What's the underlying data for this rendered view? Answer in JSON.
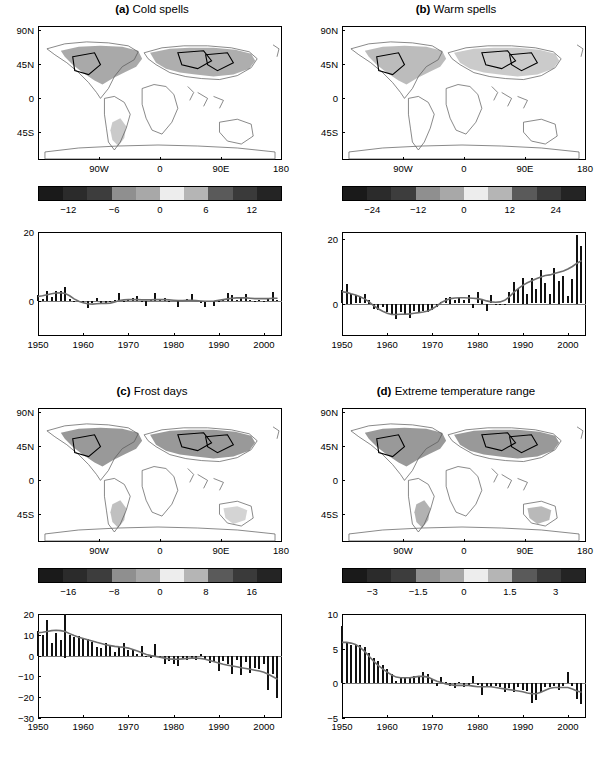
{
  "figure": {
    "panels": [
      {
        "key": "a",
        "tag": "(a)",
        "title": "Cold spells",
        "map": {
          "ylabels": [
            "90N",
            "45N",
            "0",
            "45S"
          ],
          "xlabels": [
            "90W",
            "0",
            "90E",
            "180"
          ]
        },
        "colorbar": {
          "ticks": [
            "−12",
            "−6",
            "0",
            "6",
            "12"
          ],
          "colors": [
            "#1a1a1a",
            "#2b2b2b",
            "#3d3d3d",
            "#8f8f8f",
            "#a8a8a8",
            "#ededed",
            "#b5b5b5",
            "#5a5a5a",
            "#3a3a3a",
            "#242424"
          ]
        },
        "chart_data": {
          "type": "bar",
          "title": "Cold spells anomaly",
          "xlabel": "",
          "ylabel": "",
          "ylim": [
            -10,
            20
          ],
          "xlim": [
            1950,
            2004
          ],
          "yticks": [
            0,
            20
          ],
          "ytick_labels": [
            "0",
            "20"
          ],
          "xticks": [
            1950,
            1960,
            1970,
            1980,
            1990,
            2000
          ],
          "xtick_labels": [
            "1950",
            "1960",
            "1970",
            "1980",
            "1990",
            "2000"
          ],
          "grid": false,
          "legend": "none",
          "x": [
            1950,
            1951,
            1952,
            1953,
            1954,
            1955,
            1956,
            1957,
            1958,
            1959,
            1960,
            1961,
            1962,
            1963,
            1964,
            1965,
            1966,
            1967,
            1968,
            1969,
            1970,
            1971,
            1972,
            1973,
            1974,
            1975,
            1976,
            1977,
            1978,
            1979,
            1980,
            1981,
            1982,
            1983,
            1984,
            1985,
            1986,
            1987,
            1988,
            1989,
            1990,
            1991,
            1992,
            1993,
            1994,
            1995,
            1996,
            1997,
            1998,
            1999,
            2000,
            2001,
            2002,
            2003
          ],
          "values": [
            1.8,
            0.6,
            3.0,
            1.2,
            3.1,
            3.0,
            4.0,
            0.8,
            0.2,
            -0.2,
            -0.4,
            -1.9,
            -0.6,
            0.9,
            -0.8,
            -0.6,
            -0.3,
            0.4,
            2.4,
            0.2,
            0.5,
            0.9,
            1.6,
            -0.2,
            -1.4,
            0.6,
            2.4,
            0.3,
            0.9,
            0.2,
            0.5,
            -1.5,
            0.5,
            0.7,
            2.1,
            0.4,
            -0.4,
            -1.6,
            0.2,
            -1.3,
            -0.3,
            0.6,
            2.3,
            1.8,
            0.5,
            0.9,
            2.2,
            0.4,
            0.2,
            0.3,
            0.2,
            0.6,
            2.6,
            0.5
          ],
          "smooth": [
            1.4,
            1.6,
            1.9,
            2.2,
            2.4,
            2.5,
            2.3,
            1.6,
            0.7,
            0.0,
            -0.4,
            -0.7,
            -0.8,
            -0.7,
            -0.6,
            -0.6,
            -0.5,
            -0.2,
            0.2,
            0.4,
            0.5,
            0.5,
            0.5,
            0.4,
            0.4,
            0.4,
            0.5,
            0.5,
            0.5,
            0.4,
            0.3,
            0.2,
            0.2,
            0.3,
            0.3,
            0.2,
            0.1,
            0.0,
            0.0,
            0.1,
            0.3,
            0.5,
            0.7,
            0.9,
            1.0,
            1.0,
            1.0,
            0.9,
            0.8,
            0.8,
            0.8,
            0.8,
            0.9,
            0.9
          ]
        }
      },
      {
        "key": "b",
        "tag": "(b)",
        "title": "Warm spells",
        "map": {
          "ylabels": [
            "90N",
            "45N",
            "0",
            "45S"
          ],
          "xlabels": [
            "90W",
            "0",
            "90E",
            "180"
          ]
        },
        "colorbar": {
          "ticks": [
            "−24",
            "−12",
            "0",
            "12",
            "24"
          ],
          "colors": [
            "#1a1a1a",
            "#2b2b2b",
            "#3d3d3d",
            "#8f8f8f",
            "#a8a8a8",
            "#ededed",
            "#b5b5b5",
            "#5a5a5a",
            "#3a3a3a",
            "#242424"
          ]
        },
        "chart_data": {
          "type": "bar",
          "title": "Warm spells anomaly",
          "xlabel": "",
          "ylabel": "",
          "ylim": [
            -10,
            22
          ],
          "xlim": [
            1950,
            2004
          ],
          "yticks": [
            0,
            20
          ],
          "ytick_labels": [
            "0",
            "20"
          ],
          "xticks": [
            1950,
            1960,
            1970,
            1980,
            1990,
            2000
          ],
          "xtick_labels": [
            "1950",
            "1960",
            "1970",
            "1980",
            "1990",
            "2000"
          ],
          "grid": false,
          "legend": "none",
          "x": [
            1950,
            1951,
            1952,
            1953,
            1954,
            1955,
            1956,
            1957,
            1958,
            1959,
            1960,
            1961,
            1962,
            1963,
            1964,
            1965,
            1966,
            1967,
            1968,
            1969,
            1970,
            1971,
            1972,
            1973,
            1974,
            1975,
            1976,
            1977,
            1978,
            1979,
            1980,
            1981,
            1982,
            1983,
            1984,
            1985,
            1986,
            1987,
            1988,
            1989,
            1990,
            1991,
            1992,
            1993,
            1994,
            1995,
            1996,
            1997,
            1998,
            1999,
            2000,
            2001,
            2002,
            2003
          ],
          "values": [
            4.2,
            6.0,
            3.0,
            2.6,
            2.4,
            2.8,
            1.0,
            -1.6,
            -2.0,
            -1.2,
            -2.6,
            -3.6,
            -4.8,
            -2.6,
            -3.2,
            -4.4,
            -2.2,
            -3.0,
            -2.2,
            -2.6,
            -2.0,
            -1.0,
            0.6,
            1.6,
            2.0,
            1.2,
            1.8,
            1.2,
            2.6,
            -1.4,
            3.4,
            1.0,
            -2.2,
            2.6,
            -0.6,
            -0.4,
            -0.6,
            3.6,
            6.6,
            4.4,
            8.0,
            3.0,
            7.8,
            4.6,
            10.2,
            6.4,
            3.0,
            10.8,
            7.0,
            8.6,
            2.4,
            7.4,
            21.0,
            17.6
          ],
          "smooth": [
            3.6,
            3.4,
            3.0,
            2.6,
            2.1,
            1.4,
            0.5,
            -0.6,
            -1.6,
            -2.4,
            -3.0,
            -3.4,
            -3.4,
            -3.3,
            -3.3,
            -3.2,
            -3.0,
            -2.8,
            -2.6,
            -2.3,
            -1.6,
            -0.7,
            0.3,
            1.0,
            1.5,
            1.7,
            1.8,
            1.8,
            1.7,
            1.6,
            1.5,
            1.2,
            0.8,
            0.5,
            0.4,
            0.5,
            1.0,
            2.0,
            3.4,
            4.6,
            5.6,
            6.4,
            7.0,
            7.6,
            8.2,
            8.6,
            8.8,
            9.2,
            9.6,
            10.0,
            10.6,
            11.4,
            12.4,
            13.2
          ]
        }
      },
      {
        "key": "c",
        "tag": "(c)",
        "title": "Frost days",
        "map": {
          "ylabels": [
            "90N",
            "45N",
            "0",
            "45S"
          ],
          "xlabels": [
            "90W",
            "0",
            "90E",
            "180"
          ]
        },
        "colorbar": {
          "ticks": [
            "−16",
            "−8",
            "0",
            "8",
            "16"
          ],
          "colors": [
            "#1a1a1a",
            "#2b2b2b",
            "#3d3d3d",
            "#8f8f8f",
            "#a8a8a8",
            "#ededed",
            "#b5b5b5",
            "#5a5a5a",
            "#3a3a3a",
            "#242424"
          ]
        },
        "chart_data": {
          "type": "bar",
          "title": "Frost days anomaly",
          "xlabel": "",
          "ylabel": "",
          "ylim": [
            -30,
            20
          ],
          "xlim": [
            1950,
            2004
          ],
          "yticks": [
            -30,
            -20,
            -10,
            0,
            10,
            20
          ],
          "ytick_labels": [
            "−30",
            "−20",
            "−10",
            "0",
            "10",
            "20"
          ],
          "xticks": [
            1950,
            1960,
            1970,
            1980,
            1990,
            2000
          ],
          "xtick_labels": [
            "1950",
            "1960",
            "1970",
            "1980",
            "1990",
            "2000"
          ],
          "grid": false,
          "legend": "none",
          "x": [
            1950,
            1951,
            1952,
            1953,
            1954,
            1955,
            1956,
            1957,
            1958,
            1959,
            1960,
            1961,
            1962,
            1963,
            1964,
            1965,
            1966,
            1967,
            1968,
            1969,
            1970,
            1971,
            1972,
            1973,
            1974,
            1975,
            1976,
            1977,
            1978,
            1979,
            1980,
            1981,
            1982,
            1983,
            1984,
            1985,
            1986,
            1987,
            1988,
            1989,
            1990,
            1991,
            1992,
            1993,
            1994,
            1995,
            1996,
            1997,
            1998,
            1999,
            2000,
            2001,
            2002,
            2003
          ],
          "values": [
            12.0,
            10.0,
            17.0,
            6.0,
            11.0,
            7.5,
            21.0,
            10.0,
            9.0,
            9.5,
            8.0,
            8.0,
            6.5,
            4.0,
            3.5,
            6.0,
            5.0,
            1.5,
            4.0,
            6.0,
            2.5,
            3.0,
            1.0,
            4.5,
            -0.5,
            -1.0,
            5.5,
            -1.0,
            -4.0,
            -2.5,
            -4.0,
            -5.0,
            -1.5,
            -2.0,
            -1.5,
            -2.0,
            1.0,
            -1.5,
            -3.5,
            -3.0,
            -7.5,
            -2.5,
            -4.0,
            -9.0,
            -2.0,
            -9.5,
            -3.0,
            -8.5,
            -6.0,
            -6.5,
            -4.0,
            -16.5,
            -9.0,
            -20.5
          ],
          "smooth": [
            11.0,
            11.2,
            11.6,
            12.0,
            12.2,
            12.0,
            11.6,
            10.6,
            9.6,
            8.8,
            8.2,
            7.6,
            7.0,
            6.4,
            5.8,
            5.2,
            4.8,
            4.4,
            4.2,
            4.0,
            3.6,
            3.0,
            2.2,
            1.4,
            0.6,
            0.0,
            -0.4,
            -0.8,
            -1.2,
            -1.6,
            -1.8,
            -1.8,
            -1.6,
            -1.4,
            -1.2,
            -1.2,
            -1.4,
            -1.8,
            -2.4,
            -3.0,
            -3.6,
            -4.2,
            -4.6,
            -5.0,
            -5.4,
            -5.8,
            -6.2,
            -6.6,
            -7.0,
            -7.4,
            -8.0,
            -9.0,
            -10.2,
            -11.4
          ]
        }
      },
      {
        "key": "d",
        "tag": "(d)",
        "title": "Extreme temperature range",
        "map": {
          "ylabels": [
            "90N",
            "45N",
            "0",
            "45S"
          ],
          "xlabels": [
            "90W",
            "0",
            "90E",
            "180"
          ]
        },
        "colorbar": {
          "ticks": [
            "−3",
            "−1.5",
            "0",
            "1.5",
            "3"
          ],
          "colors": [
            "#1a1a1a",
            "#2b2b2b",
            "#3d3d3d",
            "#8f8f8f",
            "#a8a8a8",
            "#ededed",
            "#b5b5b5",
            "#5a5a5a",
            "#3a3a3a",
            "#242424"
          ]
        },
        "chart_data": {
          "type": "bar",
          "title": "Extreme temperature range anomaly",
          "xlabel": "",
          "ylabel": "",
          "ylim": [
            -5,
            10
          ],
          "xlim": [
            1950,
            2004
          ],
          "yticks": [
            -5,
            0,
            5,
            10
          ],
          "ytick_labels": [
            "−5",
            "0",
            "5",
            "10"
          ],
          "xticks": [
            1950,
            1960,
            1970,
            1980,
            1990,
            2000
          ],
          "xtick_labels": [
            "1950",
            "1960",
            "1970",
            "1980",
            "1990",
            "2000"
          ],
          "grid": false,
          "legend": "none",
          "x": [
            1950,
            1951,
            1952,
            1953,
            1954,
            1955,
            1956,
            1957,
            1958,
            1959,
            1960,
            1961,
            1962,
            1963,
            1964,
            1965,
            1966,
            1967,
            1968,
            1969,
            1970,
            1971,
            1972,
            1973,
            1974,
            1975,
            1976,
            1977,
            1978,
            1979,
            1980,
            1981,
            1982,
            1983,
            1984,
            1985,
            1986,
            1987,
            1988,
            1989,
            1990,
            1991,
            1992,
            1993,
            1994,
            1995,
            1996,
            1997,
            1998,
            1999,
            2000,
            2001,
            2002,
            2003
          ],
          "values": [
            8.2,
            6.0,
            5.6,
            5.6,
            5.6,
            5.2,
            4.4,
            3.6,
            3.2,
            2.6,
            2.0,
            1.4,
            0.3,
            0.9,
            0.8,
            0.9,
            1.0,
            1.0,
            1.6,
            1.4,
            0.6,
            -0.4,
            0.9,
            0.2,
            -0.4,
            -0.7,
            0.2,
            -0.5,
            -0.4,
            1.0,
            -0.3,
            -1.7,
            -0.5,
            -0.6,
            -0.4,
            -0.6,
            -1.2,
            -0.7,
            -1.3,
            -0.5,
            -0.9,
            -1.1,
            -2.9,
            -2.4,
            -1.3,
            -0.5,
            -0.6,
            -0.4,
            -0.9,
            -0.4,
            1.6,
            -0.4,
            -2.3,
            -3.0
          ],
          "smooth": [
            5.9,
            5.9,
            5.8,
            5.6,
            5.2,
            4.6,
            3.9,
            3.2,
            2.6,
            2.1,
            1.6,
            1.2,
            0.9,
            0.8,
            0.8,
            0.8,
            0.9,
            1.0,
            1.0,
            0.9,
            0.6,
            0.3,
            0.1,
            -0.1,
            -0.2,
            -0.3,
            -0.3,
            -0.3,
            -0.3,
            -0.4,
            -0.5,
            -0.5,
            -0.5,
            -0.5,
            -0.6,
            -0.7,
            -0.8,
            -0.9,
            -1.0,
            -1.1,
            -1.2,
            -1.4,
            -1.5,
            -1.5,
            -1.3,
            -1.0,
            -0.7,
            -0.6,
            -0.6,
            -0.6,
            -0.6,
            -0.8,
            -1.1,
            -1.3
          ]
        }
      }
    ]
  }
}
